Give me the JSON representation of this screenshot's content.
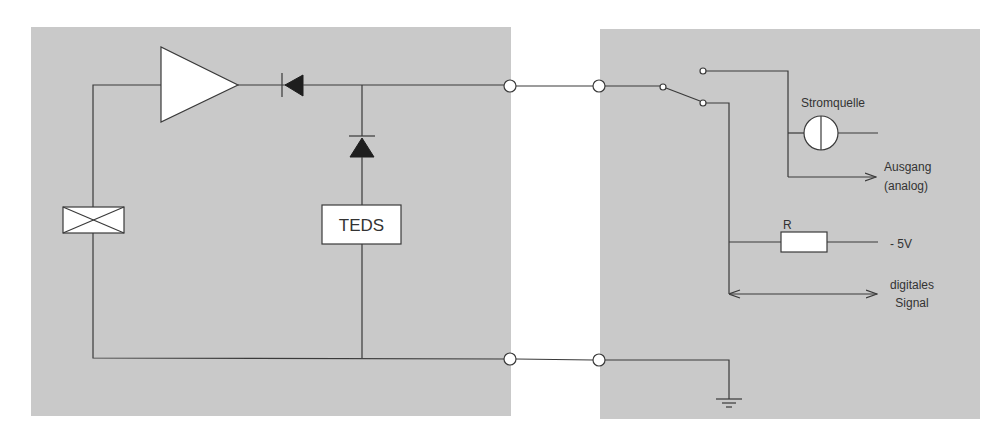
{
  "diagram": {
    "type": "circuit-schematic",
    "colors": {
      "background": "#ffffff",
      "panel": "#c9c9c9",
      "wire": "#3a3a3a",
      "component_fill": "#ffffff",
      "diode_fill": "#1e1e1e",
      "text": "#333333"
    },
    "left_panel": {
      "name": "sensor",
      "components": {
        "amplifier": "amplifier-triangle",
        "series_diode": "diode",
        "shunt_diode": "diode",
        "transducer": "crossed-box-element",
        "teds": {
          "label": "TEDS"
        }
      }
    },
    "connection": {
      "signal_line_terminals": 2,
      "ground_line_terminals": 2
    },
    "right_panel": {
      "name": "measurement-device",
      "switch": "changeover-switch",
      "labels": {
        "current_source": "Stromquelle",
        "output_line1": "Ausgang",
        "output_line2": "(analog)",
        "resistor": "R",
        "voltage": "- 5V",
        "digital_line1": "digitales",
        "digital_line2": "Signal"
      },
      "ground": "ground-symbol"
    }
  }
}
